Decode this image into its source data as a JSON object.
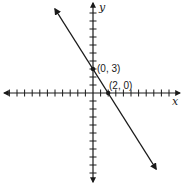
{
  "chart_data": {
    "type": "line",
    "title": "",
    "xlabel": "x",
    "ylabel": "y",
    "xlim": [
      -12,
      11
    ],
    "ylim": [
      -11,
      11
    ],
    "grid": false,
    "tick_interval": 1,
    "series": [
      {
        "name": "line",
        "equation": "y = -1.5x + 3",
        "slope": -1.5,
        "intercept": 3,
        "x": [
          -5,
          0,
          2,
          8.3
        ],
        "y": [
          10.5,
          3,
          0,
          -9.5
        ],
        "arrows_both_ends": true
      }
    ],
    "points": [
      {
        "x": 0,
        "y": 3,
        "label": "(0, 3)"
      },
      {
        "x": 2,
        "y": 0,
        "label": "(2, 0)"
      }
    ]
  },
  "labels": {
    "x_axis": "x",
    "y_axis": "y",
    "point_a": "(0, 3)",
    "point_b": "(2, 0)"
  },
  "colors": {
    "ink": "#1a1a1a",
    "background": "#ffffff"
  }
}
